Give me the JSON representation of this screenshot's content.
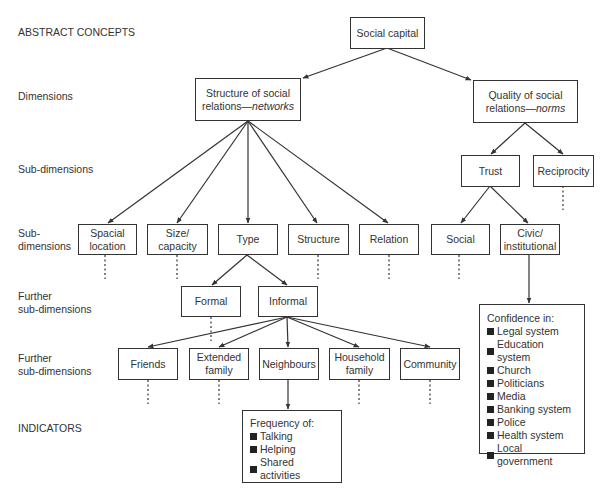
{
  "row_labels": {
    "abstract_concepts": "ABSTRACT CONCEPTS",
    "dimensions": "Dimensions",
    "sub_dimensions_1": "Sub-dimensions",
    "sub_dimensions_2_line1": "Sub-",
    "sub_dimensions_2_line2": "dimensions",
    "further_1_line1": "Further",
    "further_1_line2": "sub-dimensions",
    "further_2_line1": "Further",
    "further_2_line2": "sub-dimensions",
    "indicators": "INDICATORS"
  },
  "nodes": {
    "social_capital": "Social capital",
    "structure": {
      "line1": "Structure of social",
      "line2_prefix": "relations—",
      "line2_italic": "networks"
    },
    "quality": {
      "line1": "Quality of social",
      "line2_prefix": "relations—",
      "line2_italic": "norms"
    },
    "trust": "Trust",
    "reciprocity": "Reciprocity",
    "spacial_location": {
      "line1": "Spacial",
      "line2": "location"
    },
    "size_capacity": {
      "line1": "Size/",
      "line2": "capacity"
    },
    "type": "Type",
    "structure_sub": "Structure",
    "relation": "Relation",
    "social": "Social",
    "civic_institutional": {
      "line1": "Civic/",
      "line2": "institutional"
    },
    "formal": "Formal",
    "informal": "Informal",
    "friends": "Friends",
    "extended_family": {
      "line1": "Extended",
      "line2": "family"
    },
    "neighbours": "Neighbours",
    "household_family": {
      "line1": "Household",
      "line2": "family"
    },
    "community": "Community"
  },
  "indicators": {
    "frequency": {
      "title": "Frequency of:",
      "items": [
        "Talking",
        "Helping",
        "Shared activities"
      ]
    },
    "confidence": {
      "title": "Confidence in:",
      "items": [
        "Legal system",
        "Education system",
        "Church",
        "Politicians",
        "Media",
        "Banking system",
        "Police",
        "Health system",
        "Local government"
      ]
    }
  },
  "colors": {
    "line": "#333333",
    "text": "#333333",
    "background": "#ffffff"
  }
}
